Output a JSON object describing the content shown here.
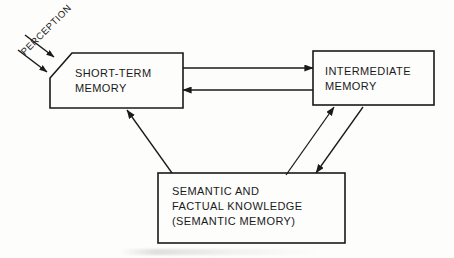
{
  "diagram": {
    "stroke_color": "#1a1a1a",
    "background_color": "#fdfdfc",
    "boxes": [
      {
        "id": "short-term-memory",
        "lines": [
          "SHORT-TERM",
          "MEMORY"
        ]
      },
      {
        "id": "intermediate-memory",
        "lines": [
          "INTERMEDIATE",
          "MEMORY"
        ]
      },
      {
        "id": "semantic-memory",
        "lines": [
          "SEMANTIC AND",
          "FACTUAL KNOWLEDGE",
          "(SEMANTIC MEMORY)"
        ]
      }
    ],
    "input_label": "PERCEPTION",
    "connections": [
      {
        "from": "perception",
        "to": "short-term-memory",
        "direction": "one-way"
      },
      {
        "from": "short-term-memory",
        "to": "intermediate-memory",
        "direction": "one-way"
      },
      {
        "from": "intermediate-memory",
        "to": "short-term-memory",
        "direction": "one-way"
      },
      {
        "from": "semantic-memory",
        "to": "short-term-memory",
        "direction": "one-way"
      },
      {
        "from": "semantic-memory",
        "to": "intermediate-memory",
        "direction": "one-way"
      },
      {
        "from": "intermediate-memory",
        "to": "semantic-memory",
        "direction": "one-way"
      }
    ]
  }
}
